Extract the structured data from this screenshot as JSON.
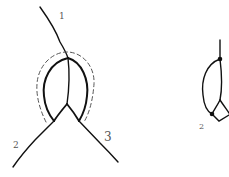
{
  "figure_left": {
    "labels": {
      "branch_1": "1",
      "branch_2": "2",
      "branch_3": "3"
    },
    "stroke_color": "#111111",
    "dashed_outline_color": "#555555"
  },
  "figure_right": {
    "labels": {
      "branch_2": "2"
    },
    "stroke_color": "#111111"
  }
}
